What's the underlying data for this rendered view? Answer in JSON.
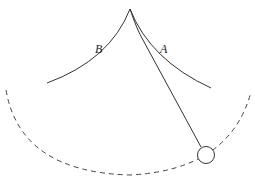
{
  "diagram": {
    "labels": {
      "A": "A",
      "B": "B"
    },
    "colors": {
      "stroke": "#333333",
      "background": "#ffffff"
    }
  }
}
